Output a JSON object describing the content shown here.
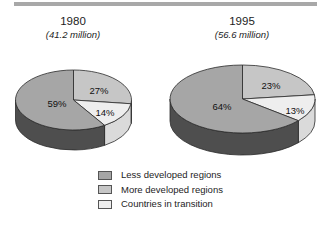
{
  "chart_data": {
    "type": "pie",
    "outline": "#2b2b2b",
    "rule_color": "#a8a8a8",
    "pies": [
      {
        "title": "1980",
        "subtitle": "(41.2 million)",
        "total_millions": 41.2,
        "slices": [
          {
            "key": "more",
            "label": "More developed regions",
            "pct": 27,
            "text": "27%"
          },
          {
            "key": "transition",
            "label": "Countries in transition",
            "pct": 14,
            "text": "14%"
          },
          {
            "key": "less",
            "label": "Less developed regions",
            "pct": 59,
            "text": "59%"
          }
        ]
      },
      {
        "title": "1995",
        "subtitle": "(56.6 million)",
        "total_millions": 56.6,
        "slices": [
          {
            "key": "more",
            "label": "More developed regions",
            "pct": 23,
            "text": "23%"
          },
          {
            "key": "transition",
            "label": "Countries in transition",
            "pct": 13,
            "text": "13%"
          },
          {
            "key": "less",
            "label": "Less developed regions",
            "pct": 64,
            "text": "64%"
          }
        ]
      }
    ],
    "legend": [
      {
        "key": "less",
        "label": "Less developed regions"
      },
      {
        "key": "more",
        "label": "More developed regions"
      },
      {
        "key": "transition",
        "label": "Countries in transition"
      }
    ],
    "colors": {
      "less": {
        "top": "#a6a6a6",
        "side": "#4e4e4e"
      },
      "more": {
        "top": "#c6c6c6",
        "side": "#9a9a9a"
      },
      "transition": {
        "top": "#eeeeee",
        "side": "#dadada"
      }
    }
  }
}
